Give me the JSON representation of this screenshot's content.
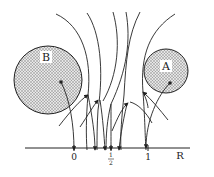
{
  "diagram": {
    "regions": [
      {
        "id": "B",
        "label": "B",
        "cx": 48,
        "cy": 80,
        "r": 34
      },
      {
        "id": "A",
        "label": "A",
        "cx": 166,
        "cy": 71,
        "r": 22
      }
    ],
    "axis": {
      "label": "R",
      "ticks": [
        {
          "value": "0",
          "x": 74
        },
        {
          "value": "1/2",
          "num": "1",
          "den": "2",
          "x": 111
        },
        {
          "value": "1",
          "x": 148
        }
      ]
    },
    "colors": {
      "ink": "#222222",
      "fill": "#bdbdbd",
      "background": "#ffffff"
    }
  }
}
